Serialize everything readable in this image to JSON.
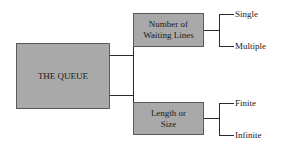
{
  "diagram": {
    "root": {
      "label": "THE QUEUE"
    },
    "branches": [
      {
        "label_line1": "Number of",
        "label_line2": "Waiting Lines",
        "children": [
          {
            "label": "Single"
          },
          {
            "label": "Multiple"
          }
        ]
      },
      {
        "label_line1": "Length or",
        "label_line2": "Size",
        "children": [
          {
            "label": "Finite"
          },
          {
            "label": "Infinite"
          }
        ]
      }
    ],
    "colors": {
      "box_fill": "#a9a9a9",
      "box_border": "#5a5a5a",
      "line": "#2a2a2a"
    }
  }
}
